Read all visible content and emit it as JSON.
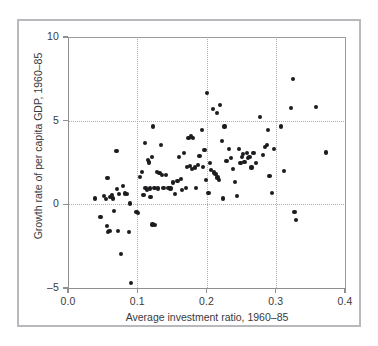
{
  "chart_data": {
    "type": "scatter",
    "title": "",
    "xlabel": "Average investment ratio, 1960–85",
    "ylabel": "Growth rate of per capita GDP, 1960–85",
    "xlim": [
      0.0,
      0.4
    ],
    "ylim": [
      -5,
      10
    ],
    "xticks": [
      0.0,
      0.1,
      0.2,
      0.3,
      0.4
    ],
    "xtick_labels": [
      "0.0",
      "0.1",
      "0.2",
      "0.3",
      "0.4"
    ],
    "yticks": [
      -5,
      0,
      5,
      10
    ],
    "ytick_labels": [
      "–5",
      "0",
      "5",
      "10"
    ],
    "grid": "dotted gridlines at y=0, y=5 and x=0.1, 0.2, 0.3",
    "legend": "none",
    "marker_color": "#1c1c1e",
    "axis_color": "#8e8f93",
    "grid_color": "#adaeb2",
    "frame_color": "#b8b9bd",
    "background_color": "#ffffff",
    "points": [
      [
        0.039,
        0.35
      ],
      [
        0.047,
        -0.75
      ],
      [
        0.052,
        0.5
      ],
      [
        0.055,
        0.3
      ],
      [
        0.057,
        1.55
      ],
      [
        0.056,
        -1.3
      ],
      [
        0.058,
        -1.65
      ],
      [
        0.06,
        -1.6
      ],
      [
        0.061,
        0.45
      ],
      [
        0.063,
        0.55
      ],
      [
        0.065,
        0.35
      ],
      [
        0.066,
        -0.4
      ],
      [
        0.07,
        3.2
      ],
      [
        0.071,
        0.9
      ],
      [
        0.072,
        -1.6
      ],
      [
        0.074,
        0.6
      ],
      [
        0.076,
        -2.95
      ],
      [
        0.079,
        1.1
      ],
      [
        0.082,
        0.65
      ],
      [
        0.085,
        0.6
      ],
      [
        0.088,
        -1.65
      ],
      [
        0.09,
        0.05
      ],
      [
        0.091,
        -4.7
      ],
      [
        0.099,
        -0.45
      ],
      [
        0.101,
        -0.5
      ],
      [
        0.104,
        1.65
      ],
      [
        0.107,
        1.95
      ],
      [
        0.109,
        0.55
      ],
      [
        0.111,
        3.65
      ],
      [
        0.112,
        1.0
      ],
      [
        0.114,
        0.85
      ],
      [
        0.115,
        2.65
      ],
      [
        0.117,
        2.5
      ],
      [
        0.118,
        0.95
      ],
      [
        0.119,
        0.45
      ],
      [
        0.121,
        2.85
      ],
      [
        0.122,
        -1.2
      ],
      [
        0.123,
        4.65
      ],
      [
        0.125,
        1.0
      ],
      [
        0.126,
        -1.25
      ],
      [
        0.128,
        1.95
      ],
      [
        0.13,
        0.95
      ],
      [
        0.132,
        1.85
      ],
      [
        0.134,
        3.55
      ],
      [
        0.136,
        1.75
      ],
      [
        0.138,
        1.0
      ],
      [
        0.142,
        1.75
      ],
      [
        0.145,
        1.0
      ],
      [
        0.148,
        0.95
      ],
      [
        0.152,
        1.3
      ],
      [
        0.155,
        0.6
      ],
      [
        0.158,
        1.4
      ],
      [
        0.16,
        2.85
      ],
      [
        0.163,
        1.5
      ],
      [
        0.165,
        0.85
      ],
      [
        0.168,
        3.05
      ],
      [
        0.17,
        1.0
      ],
      [
        0.172,
        2.25
      ],
      [
        0.174,
        3.95
      ],
      [
        0.176,
        2.3
      ],
      [
        0.178,
        4.05
      ],
      [
        0.179,
        2.1
      ],
      [
        0.181,
        3.95
      ],
      [
        0.183,
        2.2
      ],
      [
        0.185,
        1.0
      ],
      [
        0.188,
        2.35
      ],
      [
        0.19,
        2.9
      ],
      [
        0.193,
        4.45
      ],
      [
        0.195,
        2.25
      ],
      [
        0.197,
        3.25
      ],
      [
        0.199,
        1.45
      ],
      [
        0.201,
        6.65
      ],
      [
        0.203,
        0.7
      ],
      [
        0.205,
        2.45
      ],
      [
        0.207,
        2.05
      ],
      [
        0.209,
        5.7
      ],
      [
        0.211,
        1.9
      ],
      [
        0.213,
        1.8
      ],
      [
        0.215,
        5.45
      ],
      [
        0.216,
        1.6
      ],
      [
        0.218,
        1.45
      ],
      [
        0.22,
        5.95
      ],
      [
        0.222,
        3.8
      ],
      [
        0.224,
        0.35
      ],
      [
        0.226,
        4.65
      ],
      [
        0.229,
        2.6
      ],
      [
        0.232,
        3.3
      ],
      [
        0.235,
        2.75
      ],
      [
        0.238,
        2.1
      ],
      [
        0.241,
        1.35
      ],
      [
        0.244,
        0.5
      ],
      [
        0.247,
        3.3
      ],
      [
        0.249,
        2.45
      ],
      [
        0.251,
        2.85
      ],
      [
        0.253,
        3.0
      ],
      [
        0.255,
        2.55
      ],
      [
        0.258,
        3.05
      ],
      [
        0.26,
        2.75
      ],
      [
        0.262,
        2.85
      ],
      [
        0.265,
        2.2
      ],
      [
        0.268,
        3.05
      ],
      [
        0.272,
        2.45
      ],
      [
        0.277,
        5.2
      ],
      [
        0.282,
        2.95
      ],
      [
        0.285,
        3.45
      ],
      [
        0.287,
        3.55
      ],
      [
        0.289,
        4.45
      ],
      [
        0.291,
        1.7
      ],
      [
        0.294,
        0.7
      ],
      [
        0.297,
        3.3
      ],
      [
        0.308,
        4.65
      ],
      [
        0.312,
        2.0
      ],
      [
        0.322,
        5.75
      ],
      [
        0.325,
        7.5
      ],
      [
        0.327,
        -0.45
      ],
      [
        0.329,
        -0.95
      ],
      [
        0.358,
        5.8
      ],
      [
        0.372,
        3.1
      ]
    ]
  }
}
